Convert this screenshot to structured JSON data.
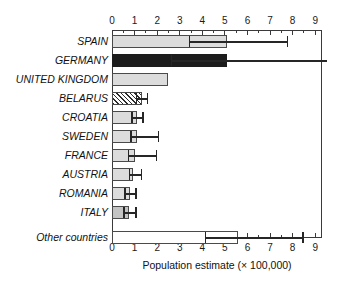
{
  "chart_data": {
    "type": "bar",
    "orientation": "horizontal",
    "title": "",
    "xlabel": "Population estimate (× 100,000)",
    "ylabel": "",
    "xlim": [
      0,
      9.3
    ],
    "xticks": [
      0,
      1,
      2,
      3,
      4,
      5,
      6,
      7,
      8,
      9
    ],
    "xtick_labels": [
      "0",
      "1",
      "2",
      "3",
      "4",
      "5",
      "6",
      "7",
      "8",
      "9"
    ],
    "minor_tick_step": 0.5,
    "grid": false,
    "legend": "none",
    "axis_positions": [
      "top",
      "bottom"
    ],
    "categories": [
      "SPAIN",
      "GERMANY",
      "UNITED KINGDOM",
      "BELARUS",
      "CROATIA",
      "SWEDEN",
      "FRANCE",
      "AUSTRIA",
      "ROMANIA",
      "ITALY",
      "Other countries"
    ],
    "values": [
      5.1,
      5.1,
      2.5,
      1.35,
      1.1,
      1.1,
      1.0,
      0.95,
      0.8,
      0.75,
      5.6
    ],
    "error_low": [
      3.4,
      2.6,
      null,
      1.05,
      0.85,
      0.8,
      0.7,
      0.75,
      0.55,
      0.5,
      4.1
    ],
    "error_high": [
      7.8,
      9.5,
      null,
      1.6,
      1.4,
      2.1,
      2.0,
      1.35,
      1.1,
      1.1,
      8.5
    ],
    "bar_styles": [
      "fill-light",
      "fill-dark",
      "fill-light",
      "fill-hatch",
      "fill-light",
      "fill-light",
      "fill-light",
      "fill-light",
      "fill-light",
      "fill-mid",
      "fill-white"
    ]
  },
  "colors": {
    "axis": "#3a3a3a",
    "bar_light": "#dcdcdc",
    "bar_mid": "#c3c3c3",
    "bar_dark": "#1c1c1c",
    "bar_white": "#ffffff",
    "error": "#262626",
    "text": "#111111"
  }
}
